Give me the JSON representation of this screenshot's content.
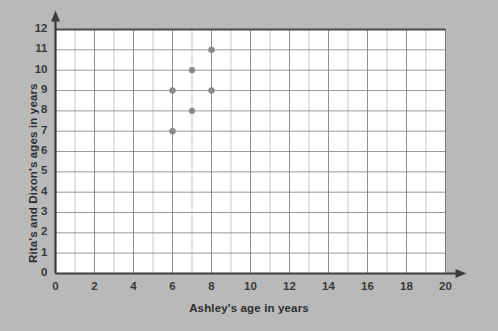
{
  "chart_data": {
    "type": "scatter",
    "title": "",
    "xlabel": "Ashley's age in years",
    "ylabel": "Rita's and Dixon's ages in years",
    "xlim": [
      0,
      20
    ],
    "ylim": [
      0,
      12
    ],
    "x_major_step": 2,
    "y_major_step": 1,
    "x_minor_step": 1,
    "grid": true,
    "legend": "none",
    "x_tick_labels": [
      "0",
      "2",
      "4",
      "6",
      "8",
      "10",
      "12",
      "14",
      "16",
      "18",
      "20"
    ],
    "y_tick_labels": [
      "0",
      "1",
      "2",
      "3",
      "4",
      "5",
      "6",
      "7",
      "8",
      "9",
      "10",
      "11",
      "12"
    ],
    "points": [
      {
        "x": 6,
        "y": 7
      },
      {
        "x": 6,
        "y": 9
      },
      {
        "x": 7,
        "y": 8
      },
      {
        "x": 7,
        "y": 10
      },
      {
        "x": 8,
        "y": 9
      },
      {
        "x": 8,
        "y": 11
      }
    ],
    "colors": {
      "background": "#b9b9b9",
      "plot_background": "#ffffff",
      "axis": "#3d3d3d",
      "grid_major": "#7a7a7a",
      "grid_minor": "#c9c9c9",
      "point": "#8a8a8a",
      "text": "#2e2e2e"
    }
  }
}
